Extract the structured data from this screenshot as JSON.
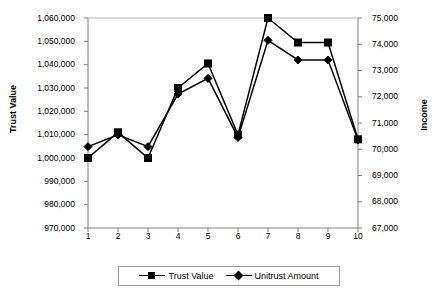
{
  "chart_data": {
    "type": "line",
    "title": "",
    "xlabel": "",
    "ylabel": "Trust Value",
    "y2label": "Income",
    "categories": [
      "1",
      "2",
      "3",
      "4",
      "5",
      "6",
      "7",
      "8",
      "9",
      "10"
    ],
    "x": [
      1,
      2,
      3,
      4,
      5,
      6,
      7,
      8,
      9,
      10
    ],
    "grid": false,
    "legend_position": "bottom",
    "ylim": [
      970000,
      1060000
    ],
    "y2lim": [
      67000,
      75000
    ],
    "ytick_labels": [
      "1,060,000",
      "1,050,000",
      "1,040,000",
      "1,030,000",
      "1,020,000",
      "1,010,000",
      "1,000,000",
      "990,000",
      "980,000",
      "970,000"
    ],
    "ytick_values": [
      1060000,
      1050000,
      1040000,
      1030000,
      1020000,
      1010000,
      1000000,
      990000,
      980000,
      970000
    ],
    "y2tick_labels": [
      "75,000",
      "74,000",
      "73,000",
      "72,000",
      "71,000",
      "70,000",
      "69,000",
      "68,000",
      "67,000"
    ],
    "y2tick_values": [
      75000,
      74000,
      73000,
      72000,
      71000,
      70000,
      69000,
      68000,
      67000
    ],
    "series": [
      {
        "name": "Trust Value",
        "axis": "left",
        "marker": "square",
        "color": "#000000",
        "values": [
          1000000,
          1011000,
          1000000,
          1030000,
          1040500,
          1010000,
          1060000,
          1049500,
          1049500,
          1008000
        ]
      },
      {
        "name": "Unitrust Amount",
        "axis": "right",
        "marker": "diamond",
        "color": "#000000",
        "values": [
          70100,
          70550,
          70100,
          72100,
          72700,
          70450,
          74150,
          73400,
          73400,
          70350
        ]
      }
    ]
  },
  "legend": {
    "entries": [
      {
        "label": "Trust Value",
        "marker": "square"
      },
      {
        "label": "Unitrust Amount",
        "marker": "diamond"
      }
    ]
  },
  "axes": {
    "left_title": "Trust Value",
    "right_title": "Income"
  }
}
